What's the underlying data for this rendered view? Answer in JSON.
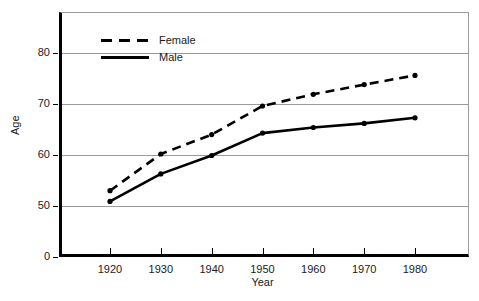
{
  "chart_data": {
    "type": "line",
    "title": "",
    "xlabel": "Year",
    "ylabel": "Age",
    "x": [
      1920,
      1930,
      1940,
      1950,
      1960,
      1970,
      1980
    ],
    "xtick_labels": [
      "1920",
      "1930",
      "1940",
      "1950",
      "1960",
      "1970",
      "1980"
    ],
    "ytick_labels": [
      "80",
      "70",
      "60",
      "50",
      "0"
    ],
    "ytick_values": [
      80,
      70,
      60,
      50,
      0
    ],
    "ylim": [
      0,
      85
    ],
    "axis_break": true,
    "grid": true,
    "legend_position": "upper-left-inside",
    "series": [
      {
        "name": "Female",
        "style": "dashed",
        "color": "#000000",
        "values": [
          53.0,
          60.2,
          64.0,
          69.6,
          71.9,
          73.8,
          75.6
        ]
      },
      {
        "name": "Male",
        "style": "solid",
        "color": "#000000",
        "values": [
          50.9,
          56.3,
          59.9,
          64.3,
          65.4,
          66.2,
          67.3
        ]
      }
    ]
  },
  "axes": {
    "y_title": "Age",
    "x_title": "Year"
  },
  "legend": {
    "items": [
      {
        "label": "Female",
        "style": "dashed"
      },
      {
        "label": "Male",
        "style": "solid"
      }
    ]
  }
}
